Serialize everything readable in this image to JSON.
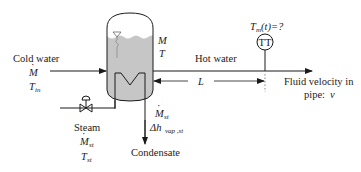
{
  "diagram": {
    "type": "process-flow",
    "colors": {
      "line": "#1a1a1a",
      "liquid": "#c6c6c6",
      "background": "#ffffff"
    },
    "tank": {
      "mass_symbol": "M",
      "temperature_symbol": "T"
    },
    "cold_water": {
      "label": "Cold water",
      "flow_symbol": "M",
      "temp_symbol": "T",
      "temp_sub": "in"
    },
    "hot_water": {
      "label": "Hot water"
    },
    "distance": {
      "symbol": "L"
    },
    "sensor": {
      "tag": "TT",
      "measurement_symbol": "T",
      "measurement_sub": "m",
      "measurement_rest": "(t)=?"
    },
    "velocity": {
      "line1": "Fluid velocity in",
      "line2": "pipe: ",
      "symbol": "v"
    },
    "steam": {
      "label": "Steam",
      "flow_symbol": "M",
      "flow_sub": "st",
      "temp_symbol": "T",
      "temp_sub": "st"
    },
    "condensate": {
      "label": "Condensate",
      "flow_symbol": "M",
      "flow_sub": "st",
      "enthalpy_symbol": "Δh",
      "enthalpy_sub": "vap ,st"
    }
  }
}
